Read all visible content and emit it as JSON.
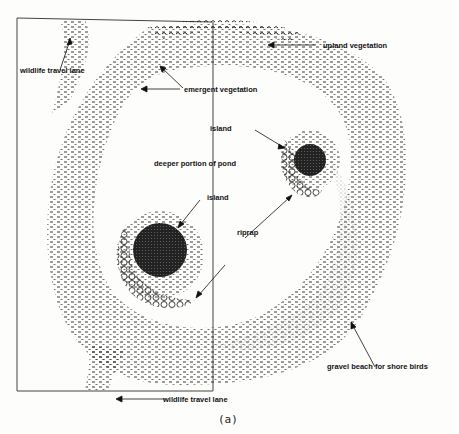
{
  "figure": {
    "caption": "(a)",
    "labels": {
      "wildlife_travel_lane_top": "wildlife travel lane",
      "upland_vegetation": "upland vegetation",
      "emergent_vegetation": "emergent vegetation",
      "island_upper": "island",
      "deeper_portion": "deeper portion of pond",
      "island_lower": "island",
      "riprap": "riprap",
      "gravel_beach": "gravel beach for shore birds",
      "wildlife_travel_lane_bottom": "wildlife travel lane"
    },
    "colors": {
      "ink": "#111111",
      "background": "#fdfdfc",
      "frame": "#444444"
    }
  }
}
